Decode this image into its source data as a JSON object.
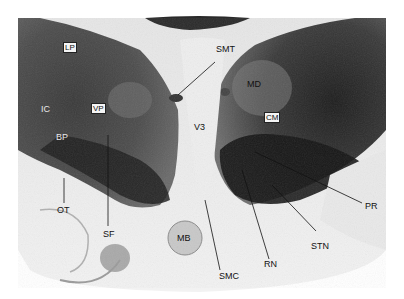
{
  "figure": {
    "labels": {
      "LP": "LP",
      "VP": "VP",
      "IC": "IC",
      "BP": "BP",
      "SMT": "SMT",
      "MD": "MD",
      "CM": "CM",
      "V3": "V3",
      "OT": "OT",
      "SF": "SF",
      "MB": "MB",
      "SMC": "SMC",
      "RN": "RN",
      "STN": "STN",
      "PR": "PR"
    }
  }
}
